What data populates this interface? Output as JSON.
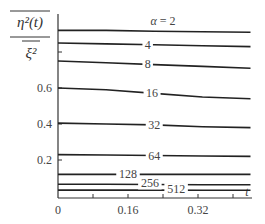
{
  "chart_data": {
    "type": "line",
    "title": "",
    "xlabel": "t",
    "ylabel": "η²(t) / ξ²",
    "ylabel_parts": {
      "numerator": "η²(t)",
      "denominator": "ξ²"
    },
    "xlim": [
      0,
      0.44
    ],
    "ylim": [
      0,
      1.0
    ],
    "x_ticks": [
      0,
      0.16,
      0.32
    ],
    "x_tick_labels": [
      "0",
      "0.16",
      "0.32"
    ],
    "x_minor_ticks": [
      0.08,
      0.24,
      0.4
    ],
    "y_ticks": [
      0.2,
      0.4,
      0.6,
      0.8
    ],
    "y_tick_labels": [
      "0.2",
      "0.4",
      "0.6",
      ""
    ],
    "grid": false,
    "legend": "inline labels on curves",
    "label_prefix": "α = ",
    "x": [
      0,
      0.11,
      0.22,
      0.33,
      0.44
    ],
    "series": [
      {
        "name": "α=2",
        "label": "α = 2",
        "values": [
          0.92,
          0.92,
          0.915,
          0.912,
          0.91
        ]
      },
      {
        "name": "α=4",
        "label": "4",
        "values": [
          0.85,
          0.845,
          0.84,
          0.835,
          0.83
        ]
      },
      {
        "name": "α=8",
        "label": "8",
        "values": [
          0.75,
          0.74,
          0.73,
          0.72,
          0.71
        ]
      },
      {
        "name": "α=16",
        "label": "16",
        "values": [
          0.6,
          0.59,
          0.57,
          0.55,
          0.54
        ]
      },
      {
        "name": "α=32",
        "label": "32",
        "values": [
          0.405,
          0.4,
          0.395,
          0.385,
          0.38
        ]
      },
      {
        "name": "α=64",
        "label": "64",
        "values": [
          0.23,
          0.228,
          0.225,
          0.222,
          0.22
        ]
      },
      {
        "name": "α=128",
        "label": "128",
        "values": [
          0.12,
          0.12,
          0.12,
          0.12,
          0.12
        ]
      },
      {
        "name": "α=256",
        "label": "256",
        "values": [
          0.065,
          0.065,
          0.064,
          0.063,
          0.063
        ]
      },
      {
        "name": "α=512",
        "label": "512",
        "values": [
          0.033,
          0.033,
          0.033,
          0.032,
          0.032
        ]
      }
    ],
    "label_positions": [
      {
        "t": 0.24,
        "dy": -6
      },
      {
        "t": 0.205,
        "dy": 4
      },
      {
        "t": 0.205,
        "dy": 4
      },
      {
        "t": 0.215,
        "dy": 4
      },
      {
        "t": 0.22,
        "dy": 4
      },
      {
        "t": 0.22,
        "dy": 4
      },
      {
        "t": 0.16,
        "dy": 4
      },
      {
        "t": 0.21,
        "dy": 3
      },
      {
        "t": 0.27,
        "dy": 3
      }
    ]
  }
}
